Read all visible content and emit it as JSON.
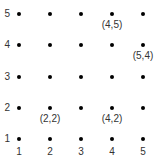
{
  "grid": {
    "columns": [
      1,
      2,
      3,
      4,
      5
    ],
    "rows": [
      1,
      2,
      3,
      4,
      5
    ],
    "col_px": [
      19,
      50,
      81,
      112,
      143
    ],
    "row_px": [
      139,
      108,
      77,
      45,
      14
    ],
    "dot_color": "#000000"
  },
  "axis": {
    "y_labels": [
      "1",
      "2",
      "3",
      "4",
      "5"
    ],
    "x_labels": [
      "1",
      "2",
      "3",
      "4",
      "5"
    ]
  },
  "highlighted_points": [
    {
      "x": 4,
      "y": 5,
      "label": "(4,5)"
    },
    {
      "x": 5,
      "y": 4,
      "label": "(5,4)"
    },
    {
      "x": 2,
      "y": 2,
      "label": "(2,2)"
    },
    {
      "x": 4,
      "y": 2,
      "label": "(4,2)"
    }
  ]
}
